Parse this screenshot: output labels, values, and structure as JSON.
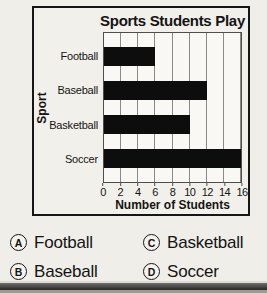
{
  "chart_data": {
    "type": "bar",
    "orientation": "horizontal",
    "title": "Sports Students Play",
    "categories": [
      "Football",
      "Baseball",
      "Basketball",
      "Soccer"
    ],
    "values": [
      6,
      12,
      10,
      16
    ],
    "xlabel": "Number of Students",
    "ylabel": "Sport",
    "xlim": [
      0,
      16
    ],
    "xticks": [
      0,
      2,
      4,
      6,
      8,
      10,
      12,
      14,
      16
    ],
    "grid": true,
    "legend": false,
    "bar_color": "#0d0d0d"
  },
  "answers": [
    {
      "letter": "A",
      "label": "Football"
    },
    {
      "letter": "B",
      "label": "Baseball"
    },
    {
      "letter": "C",
      "label": "Basketball"
    },
    {
      "letter": "D",
      "label": "Soccer"
    }
  ],
  "colors": {
    "page_background": "#f0eee8",
    "plot_background": "#f9f8f4",
    "gridline": "#8a8a8a",
    "bar": "#0d0d0d",
    "edge_band_dark": "#262626"
  }
}
